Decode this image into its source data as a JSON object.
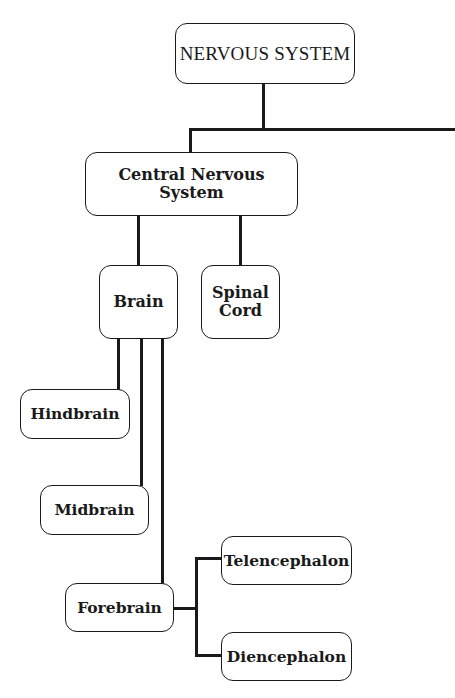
{
  "diagram": {
    "root": {
      "label": "NERVOUS SYSTEM"
    },
    "cns": {
      "label": "Central Nervous System"
    },
    "brain": {
      "label": "Brain"
    },
    "spinal_cord": {
      "line1": "Spinal",
      "line2": "Cord"
    },
    "hindbrain": {
      "label": "Hindbrain"
    },
    "midbrain": {
      "label": "Midbrain"
    },
    "forebrain": {
      "label": "Forebrain"
    },
    "telencephalon": {
      "label": "Telencephalon"
    },
    "diencephalon": {
      "label": "Diencephalon"
    }
  },
  "colors": {
    "line": "#1a1a1a",
    "background": "#ffffff"
  }
}
